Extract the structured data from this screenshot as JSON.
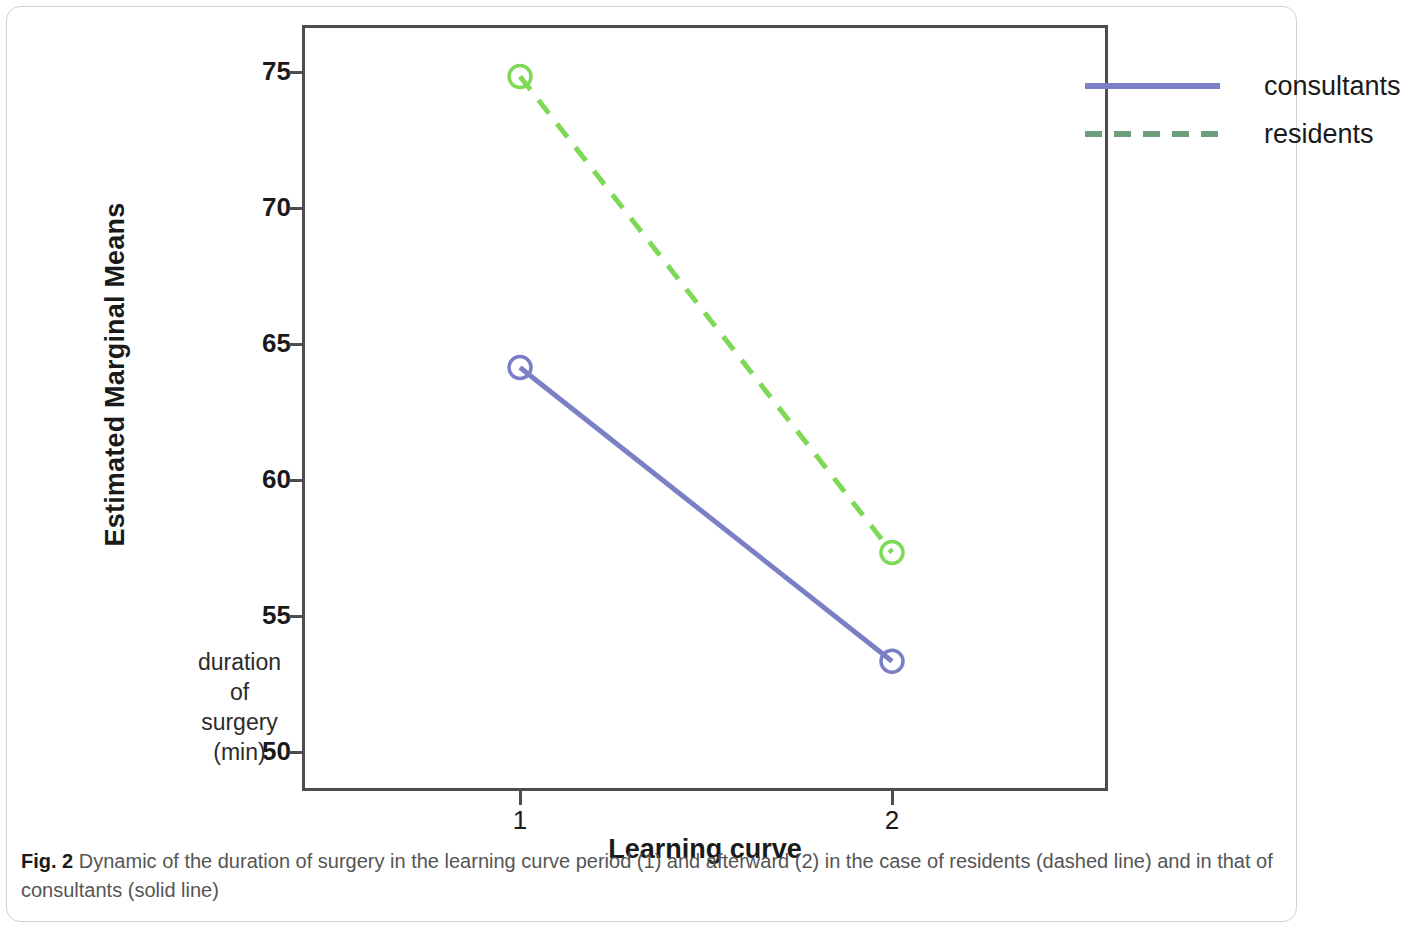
{
  "figure": {
    "caption_label": "Fig. 2",
    "caption_text": " Dynamic of the duration of surgery in the learning curve period (1) and afterward (2) in the case of residents (dashed line) and in that of consultants (solid line)"
  },
  "axis_note": {
    "line1": "duration",
    "line2": "of",
    "line3": "surgery",
    "line4": "(min)"
  },
  "colors": {
    "consultants": "#7b80c6",
    "residents": "#7ed957",
    "residents_legend": "#6e9e7c",
    "axis": "#4d4d4d",
    "text": "#1a1a1a"
  },
  "chart_data": {
    "type": "line",
    "title": "",
    "xlabel": "Learning curve",
    "ylabel": "Estimated Marginal Means",
    "x": [
      1,
      2
    ],
    "x_tick_labels": [
      "1",
      "2"
    ],
    "y_tick_labels": [
      "75",
      "70",
      "65",
      "60",
      "55",
      "50"
    ],
    "y_ticks": [
      75,
      70,
      65,
      60,
      55,
      50
    ],
    "ylim": [
      48.5,
      76.5
    ],
    "xlim": [
      0.4,
      2.6
    ],
    "grid": false,
    "legend_position": "top-right",
    "series": [
      {
        "name": "consultants",
        "values": [
          64.1,
          53.3
        ],
        "style": "solid",
        "marker": "circle-open",
        "color": "#7b80c6"
      },
      {
        "name": "residents",
        "values": [
          74.8,
          57.3
        ],
        "style": "dashed",
        "marker": "circle-open",
        "color": "#7ed957"
      }
    ]
  }
}
